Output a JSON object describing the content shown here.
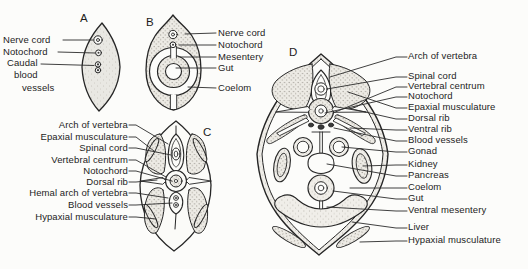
{
  "figure": {
    "colors": {
      "ink": "#262626",
      "paper": "#fcfcfa",
      "stipple": "#edebe5"
    },
    "panels": {
      "A": {
        "letter": "A",
        "labels": {
          "nerve_cord": "Nerve cord",
          "notochord": "Notochord",
          "caudal_line1": "Caudal",
          "caudal_line2": "blood",
          "caudal_line3": "vessels"
        }
      },
      "B": {
        "letter": "B",
        "labels": {
          "nerve_cord": "Nerve cord",
          "notochord": "Notochord",
          "mesentery": "Mesentery",
          "gut": "Gut",
          "coelom": "Coelom"
        }
      },
      "C": {
        "letter": "C",
        "labels": {
          "arch_of_vertebra": "Arch of vertebra",
          "epaxial_musculature": "Epaxial musculature",
          "spinal_cord": "Spinal cord",
          "vertebral_centrum": "Vertebral centrum",
          "notochord": "Notochord",
          "dorsal_rib": "Dorsal rib",
          "hemal_arch_of_vertebra": "Hemal arch of vertebra",
          "blood_vessels": "Blood vessels",
          "hypaxial_musculature": "Hypaxial musculature"
        }
      },
      "D": {
        "letter": "D",
        "labels": {
          "arch_of_vertebra": "Arch of vertebra",
          "spinal_cord": "Spinal cord",
          "vertebral_centrum": "Vertebral centrum",
          "notochord": "Notochord",
          "epaxial_musculature": "Epaxial musculature",
          "dorsal_rib": "Dorsal rib",
          "ventral_rib": "Ventral rib",
          "blood_vessels": "Blood vessels",
          "gonad": "Gonad",
          "kidney": "Kidney",
          "pancreas": "Pancreas",
          "coelom": "Coelom",
          "gut": "Gut",
          "ventral_mesentery": "Ventral mesentery",
          "liver": "Liver",
          "hypaxial_musculature": "Hypaxial musculature"
        }
      }
    }
  }
}
